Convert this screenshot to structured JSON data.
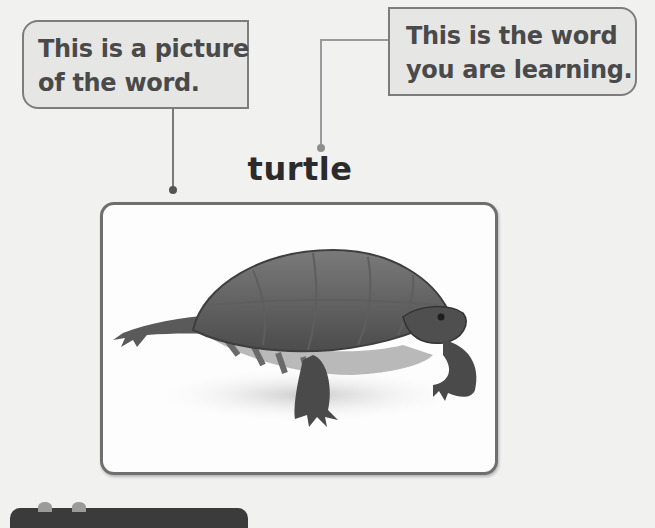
{
  "callouts": {
    "picture": {
      "lines": [
        "This is a picture",
        "of the word."
      ]
    },
    "word": {
      "lines": [
        "This is the word",
        "you are learning."
      ]
    }
  },
  "vocabulary": {
    "word": "turtle",
    "picture_alt": "photo of a turtle"
  },
  "icons": {
    "banner_sprouts": "sprout-icon"
  },
  "colors": {
    "background": "#f1f1f0",
    "callout_fill": "#e6e6e5",
    "callout_border": "#7d7d7d",
    "text": "#4a4a4a",
    "word_text": "#2b2b2b",
    "banner": "#3b3b3b"
  }
}
